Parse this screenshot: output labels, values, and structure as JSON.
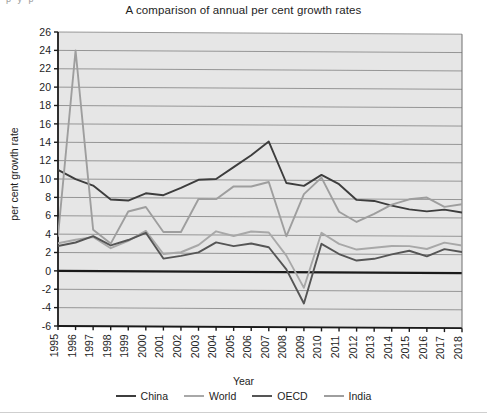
{
  "figure": {
    "title": "A comparison of annual per cent growth rates",
    "top_fragment": "p y  p",
    "plot_bg": "#e6e6e6",
    "grid_color": "#8c8c8c",
    "axis_color": "#1a1a1a"
  },
  "legend": {
    "position": "bottom-center",
    "items": [
      {
        "label": "China",
        "color": "#3d3d3d"
      },
      {
        "label": "World",
        "color": "#a8a8a8"
      },
      {
        "label": "OECD",
        "color": "#555555"
      },
      {
        "label": "India",
        "color": "#9e9e9e"
      }
    ]
  },
  "chart_data": {
    "type": "line",
    "title": "A comparison of annual per cent growth rates",
    "xlabel": "Year",
    "ylabel": "per cent growth rate",
    "grid": true,
    "ylim": [
      -6,
      26
    ],
    "ytick_step": 2,
    "yticks": [
      -6,
      -4,
      -2,
      0,
      2,
      4,
      6,
      8,
      10,
      12,
      14,
      16,
      18,
      20,
      22,
      24,
      26
    ],
    "categories": [
      "1995",
      "1996",
      "1997",
      "1998",
      "1999",
      "2000",
      "2001",
      "2002",
      "2003",
      "2004",
      "2005",
      "2006",
      "2007",
      "2008",
      "2009",
      "2010",
      "2011",
      "2012",
      "2013",
      "2014",
      "2015",
      "2016",
      "2017",
      "2018"
    ],
    "series": [
      {
        "name": "China",
        "color": "#3d3d3d",
        "values": [
          11.0,
          10.0,
          9.3,
          7.8,
          7.7,
          8.5,
          8.3,
          9.1,
          10.0,
          10.1,
          11.4,
          12.7,
          14.2,
          9.7,
          9.4,
          10.6,
          9.6,
          7.9,
          7.8,
          7.3,
          6.9,
          6.7,
          6.9,
          6.6
        ]
      },
      {
        "name": "World",
        "color": "#a8a8a8",
        "values": [
          3.0,
          3.4,
          3.7,
          2.5,
          3.3,
          4.4,
          1.9,
          2.1,
          2.9,
          4.4,
          3.9,
          4.4,
          4.3,
          1.8,
          -1.7,
          4.3,
          3.1,
          2.5,
          2.7,
          2.9,
          2.9,
          2.6,
          3.3,
          3.0
        ]
      },
      {
        "name": "OECD",
        "color": "#555555",
        "values": [
          2.7,
          3.1,
          3.8,
          2.8,
          3.4,
          4.2,
          1.4,
          1.7,
          2.1,
          3.2,
          2.8,
          3.1,
          2.7,
          0.3,
          -3.4,
          3.1,
          2.0,
          1.3,
          1.5,
          2.0,
          2.4,
          1.8,
          2.6,
          2.3
        ]
      },
      {
        "name": "India",
        "color": "#9e9e9e",
        "values": [
          3.8,
          24.0,
          4.5,
          3.0,
          6.5,
          7.0,
          4.3,
          4.3,
          7.9,
          7.9,
          9.3,
          9.3,
          9.8,
          3.9,
          8.5,
          10.3,
          6.6,
          5.5,
          6.4,
          7.4,
          8.0,
          8.2,
          7.2,
          7.5
        ]
      }
    ]
  }
}
